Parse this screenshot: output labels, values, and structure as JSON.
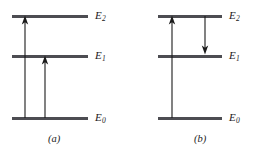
{
  "figure": {
    "type": "energy-level-diagram",
    "width": 260,
    "height": 155,
    "background_color": "#ffffff",
    "line_color": "#4d4d52",
    "arrow_color": "#1b1b1b",
    "text_color": "#1b1b1b"
  },
  "levels": {
    "e2": {
      "symbol": "E",
      "subscript": "2",
      "label": "E2"
    },
    "e1": {
      "symbol": "E",
      "subscript": "1",
      "label": "E1"
    },
    "e0": {
      "symbol": "E",
      "subscript": "0",
      "label": "E0"
    }
  },
  "panels": [
    {
      "id": "a",
      "caption": "(a)",
      "levels": [
        {
          "key": "e2",
          "symbol": "E",
          "subscript": "2",
          "y": 16,
          "x_start": 12,
          "x_end": 88
        },
        {
          "key": "e1",
          "symbol": "E",
          "subscript": "1",
          "y": 56,
          "x_start": 12,
          "x_end": 88
        },
        {
          "key": "e0",
          "symbol": "E",
          "subscript": "0",
          "y": 118,
          "x_start": 12,
          "x_end": 88
        }
      ],
      "label_x": 95,
      "transitions": [
        {
          "name": "excitation-e0-to-e2",
          "direction": "up",
          "x": 25,
          "from_level": "e0",
          "to_level": "e2",
          "y_tail": 118,
          "y_head": 17
        },
        {
          "name": "excitation-e0-to-e1",
          "direction": "up",
          "x": 45,
          "from_level": "e0",
          "to_level": "e1",
          "y_tail": 118,
          "y_head": 57
        }
      ]
    },
    {
      "id": "b",
      "caption": "(b)",
      "levels": [
        {
          "key": "e2",
          "symbol": "E",
          "subscript": "2",
          "y": 16,
          "x_start": 28,
          "x_end": 92
        },
        {
          "key": "e1",
          "symbol": "E",
          "subscript": "1",
          "y": 56,
          "x_start": 28,
          "x_end": 92
        },
        {
          "key": "e0",
          "symbol": "E",
          "subscript": "0",
          "y": 118,
          "x_start": 28,
          "x_end": 92
        }
      ],
      "label_x": 99,
      "transitions": [
        {
          "name": "excitation-e0-to-e2",
          "direction": "up",
          "x": 42,
          "from_level": "e0",
          "to_level": "e2",
          "y_tail": 118,
          "y_head": 17
        },
        {
          "name": "relaxation-e2-to-e1",
          "direction": "down",
          "x": 75,
          "from_level": "e2",
          "to_level": "e1",
          "y_tail": 17,
          "y_head": 54
        }
      ]
    }
  ]
}
